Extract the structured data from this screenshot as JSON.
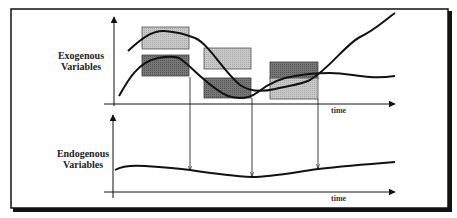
{
  "diagram": {
    "exogenous_label_line1": "Exogenous",
    "exogenous_label_line2": "Variables",
    "endogenous_label_line1": "Endogenous",
    "endogenous_label_line2": "Variables",
    "top_axis_label": "time",
    "bottom_axis_label": "time",
    "colors": {
      "light_box": "#bdbdbd",
      "dark_box": "#6f6f6f",
      "line": "#111111",
      "frame": "#111111"
    },
    "box_groups": [
      {
        "name": "window-1",
        "shades": [
          "light",
          "dark"
        ]
      },
      {
        "name": "window-2",
        "shades": [
          "light",
          "dark"
        ]
      },
      {
        "name": "window-3",
        "shades": [
          "dark",
          "light"
        ]
      }
    ]
  }
}
